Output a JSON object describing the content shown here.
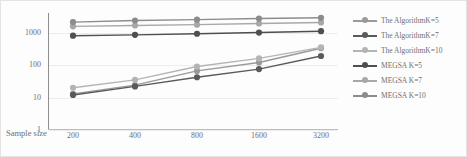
{
  "chart_data": {
    "type": "line",
    "title": "",
    "xlabel": "Sample size",
    "ylabel": "Average computing time/s",
    "yscale": "log",
    "ylim": [
      1,
      4000
    ],
    "ytick_labels": [
      "1",
      "10",
      "100",
      "1000"
    ],
    "yticks": [
      1,
      10,
      100,
      1000
    ],
    "grid": true,
    "legend_position": "right",
    "categories": [
      "200",
      "400",
      "800",
      "1600",
      "3200"
    ],
    "x": [
      200,
      400,
      800,
      1600,
      3200
    ],
    "series": [
      {
        "name": "The AlgorithmK=5",
        "color": "#9a9a9a",
        "values": [
          13,
          24,
          66,
          120,
          330
        ]
      },
      {
        "name": "The AlgorithmK=7",
        "color": "#5a5a5a",
        "values": [
          12,
          22,
          42,
          75,
          190
        ]
      },
      {
        "name": "The AlgorithmK=10",
        "color": "#b4b4b4",
        "values": [
          20,
          35,
          90,
          160,
          350
        ]
      },
      {
        "name": "MEGSA K=5",
        "color": "#4f4f4f",
        "values": [
          800,
          850,
          920,
          1000,
          1100
        ]
      },
      {
        "name": "MEGSA K=7",
        "color": "#a8a8a8",
        "values": [
          1550,
          1650,
          1750,
          1900,
          2050
        ]
      },
      {
        "name": "MEGSA K=10",
        "color": "#8c8c8c",
        "values": [
          2100,
          2350,
          2500,
          2700,
          2850
        ]
      }
    ]
  },
  "legend": {
    "items": [
      {
        "label": "The AlgorithmK=5"
      },
      {
        "label": "The AlgorithmK=7"
      },
      {
        "label": "The AlgorithmK=10"
      },
      {
        "label": "MEGSA K=5"
      },
      {
        "label": "MEGSA K=7"
      },
      {
        "label": "MEGSA K=10"
      }
    ]
  },
  "axes": {
    "y_title": "Average computing time/s",
    "x_title": "Sample size"
  }
}
